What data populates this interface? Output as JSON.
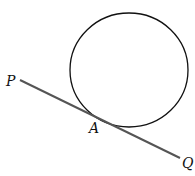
{
  "diagram": {
    "circle": {
      "cx": 129,
      "cy": 70,
      "rx": 59,
      "ry": 57,
      "stroke": "#111111"
    },
    "tangent_line": {
      "x1": 20,
      "y1": 80,
      "x2": 180,
      "y2": 158,
      "stroke": "#555555"
    },
    "labels": {
      "P": {
        "text": "P",
        "x": 6,
        "y": 86
      },
      "A": {
        "text": "A",
        "x": 90,
        "y": 133
      },
      "Q": {
        "text": "Q",
        "x": 182,
        "y": 168
      }
    }
  }
}
